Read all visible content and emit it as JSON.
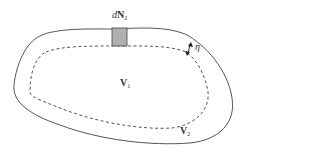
{
  "diagram": {
    "labels": {
      "dN2": {
        "prefix": "d",
        "main": "N",
        "sub": "2"
      },
      "eta": "η",
      "V1": {
        "main": "V",
        "sub": "1"
      },
      "V2": {
        "main": "V",
        "sub": "2"
      }
    },
    "colors": {
      "outer_boundary": "#555555",
      "inner_boundary": "#555555",
      "element_fill": "#b0b0b0",
      "element_stroke": "#444444"
    }
  }
}
